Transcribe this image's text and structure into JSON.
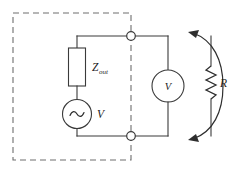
{
  "figure": {
    "type": "circuit-schematic",
    "background_color": "#ffffff",
    "line_color": "#3a3a3a",
    "dashed_color": "#6e6e6e"
  },
  "labels": {
    "source_impedance": "Z",
    "source_impedance_subscript": "out",
    "source_voltage": "V",
    "voltmeter": "V",
    "load_resistor": "R"
  },
  "components": {
    "dashed_enclosure": {
      "name": "source-model-boundary",
      "style": "dashed"
    },
    "output_impedance": {
      "name": "Z-out",
      "symbol": "rectangular-box-resistor"
    },
    "ac_source": {
      "name": "V",
      "symbol": "circle-with-sine"
    },
    "voltmeter": {
      "name": "V",
      "symbol": "circle-meter"
    },
    "resistor": {
      "name": "R",
      "symbol": "zigzag-resistor"
    },
    "terminals": {
      "top": "open-circle-node",
      "bottom": "open-circle-node",
      "count": 2
    },
    "measurement_arrow": {
      "name": "terminal-span-arrow",
      "style": "curved-double-headed",
      "direction": "both-ends-inward"
    }
  }
}
